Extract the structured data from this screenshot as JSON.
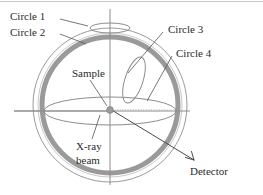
{
  "figure": {
    "background_color": "#ffffff",
    "labels": {
      "circle1": "Circle 1",
      "circle2": "Circle 2",
      "circle3": "Circle 3",
      "circle4": "Circle 4",
      "sample": "Sample",
      "xray_line1": "X-ray",
      "xray_line2": "beam",
      "detector": "Detector"
    },
    "colors": {
      "text": "#2b2b2b",
      "thin_circle": "#9a9a9a",
      "thick_ring": "#9a9a9a",
      "leader": "#555555",
      "ray": "#4a4a4a",
      "sample_dot": "#9b9b9b",
      "frame": "#c9c9c9"
    },
    "geometry": {
      "center_x": 110,
      "center_y": 105,
      "outer_circle_radius": 77,
      "thick_ring_radius": 68,
      "equatorial_ellipse_rx": 66,
      "equatorial_ellipse_ry": 14,
      "circle1_ellipse_rx": 20,
      "circle1_ellipse_ry": 5,
      "circle3_ellipse_rx": 9,
      "circle3_ellipse_ry": 24
    }
  }
}
